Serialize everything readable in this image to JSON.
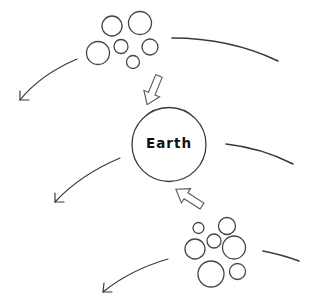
{
  "diagram": {
    "type": "concept-diagram",
    "background": "#ffffff",
    "stroke_color": "#3a3a3a",
    "earth": {
      "label": "Earth",
      "cx": 169,
      "cy": 144.5,
      "r": 37
    },
    "clusters": [
      {
        "name": "upper-particle-cluster",
        "circles": [
          {
            "cx": 112,
            "cy": 26,
            "r": 10
          },
          {
            "cx": 140,
            "cy": 23,
            "r": 11.5
          },
          {
            "cx": 98,
            "cy": 53,
            "r": 11.5
          },
          {
            "cx": 121,
            "cy": 46.5,
            "r": 7
          },
          {
            "cx": 150,
            "cy": 47,
            "r": 8
          },
          {
            "cx": 133,
            "cy": 62,
            "r": 6.5
          }
        ]
      },
      {
        "name": "lower-particle-cluster",
        "circles": [
          {
            "cx": 198.5,
            "cy": 228,
            "r": 5.5
          },
          {
            "cx": 227,
            "cy": 226,
            "r": 8.5
          },
          {
            "cx": 214,
            "cy": 241,
            "r": 7
          },
          {
            "cx": 195,
            "cy": 249,
            "r": 10
          },
          {
            "cx": 234,
            "cy": 247.5,
            "r": 11.5
          },
          {
            "cx": 211,
            "cy": 274,
            "r": 13
          },
          {
            "cx": 237.5,
            "cy": 271.5,
            "r": 8
          }
        ]
      }
    ],
    "block_arrows": [
      {
        "name": "upper-cluster-to-earth-arrow",
        "x": 159,
        "y": 76,
        "angle": 112.5,
        "direction": "toward Earth"
      },
      {
        "name": "lower-cluster-to-earth-arrow",
        "x": 202,
        "y": 206,
        "angle": 212.6,
        "direction": "toward Earth"
      }
    ],
    "flow_arrows": [
      {
        "name": "upper-left-flow-arrow",
        "d": "M 77 59 Q 40 75 20 100",
        "tip": [
          20,
          100
        ],
        "head": "M 20 91 L 20 100 L 29 100"
      },
      {
        "name": "middle-left-flow-arrow",
        "d": "M 120 158 Q 80 175 55 202",
        "tip": [
          55,
          202
        ],
        "head": "M 55 193 L 55 202 L 64 202"
      },
      {
        "name": "lower-left-flow-arrow",
        "d": "M 168 259 Q 130 270 103 292",
        "tip": [
          103,
          292
        ],
        "head": "M 104 283 L 103 292 L 112 292"
      }
    ],
    "flow_lines": [
      {
        "name": "upper-right-flow-line",
        "d": "M 172 38 Q 230 38 278 61"
      },
      {
        "name": "middle-right-flow-line",
        "d": "M 226 144 Q 262 148 293 164"
      },
      {
        "name": "lower-right-flow-line",
        "d": "M 263 251 Q 283 255 299 261"
      }
    ]
  }
}
